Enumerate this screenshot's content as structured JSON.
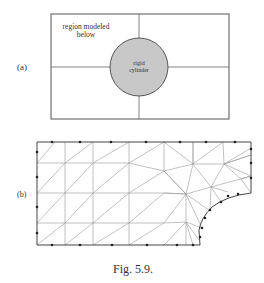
{
  "figure": {
    "caption": "Fig. 5.9.",
    "panel_a": {
      "label": "(a)",
      "region_text_line1": "region modeled",
      "region_text_line2": "below",
      "cylinder_text_line1": "rigid",
      "cylinder_text_line2": "cylinder"
    },
    "panel_b": {
      "label": "(b)"
    }
  },
  "colors": {
    "line": "#555555",
    "mesh": "#8a8a8a",
    "cylinder_fill": "#c8c8c8",
    "node": "#222222"
  }
}
